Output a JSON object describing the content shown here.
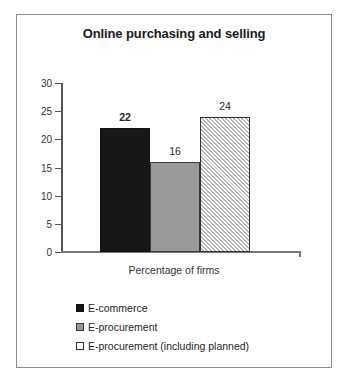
{
  "chart_data": {
    "type": "bar",
    "title": "Online purchasing and selling",
    "xlabel": "Percentage of firms",
    "ylabel": "",
    "categories": [
      "E-commerce",
      "E-procurement",
      "E-procurement (including planned)"
    ],
    "values": [
      22,
      16,
      24
    ],
    "data_labels": [
      "22",
      "16",
      "24"
    ],
    "ylim": [
      0,
      30
    ],
    "yticks": [
      0,
      5,
      10,
      15,
      20,
      25,
      30
    ],
    "ytick_labels": [
      "0",
      "5",
      "10",
      "15",
      "20",
      "25",
      "30"
    ],
    "grid": false,
    "legend_position": "bottom-left",
    "legend": [
      {
        "label": "E-commerce",
        "swatch": "solid-black"
      },
      {
        "label": "E-procurement",
        "swatch": "solid-gray"
      },
      {
        "label": "E-procurement (including planned)",
        "swatch": "hatched-white"
      }
    ],
    "colors": {
      "bar_black": "#171717",
      "bar_gray": "#9a9a9a",
      "bar_hatch_line": "#b6b6b6",
      "bar_hatch_background": "#ffffff",
      "axis": "#555555",
      "text": "#262626",
      "frame_border": "#8c8c8c",
      "background": "#ffffff"
    }
  }
}
